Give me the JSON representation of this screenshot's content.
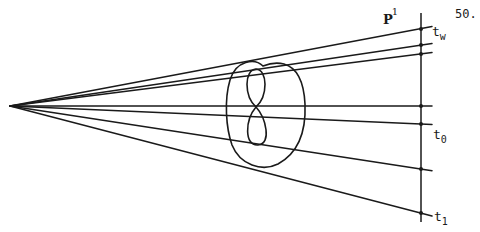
{
  "page_number": "50.",
  "labels": {
    "space": {
      "base": "P",
      "superscript": "1"
    },
    "t_w": {
      "base": "t",
      "subscript": "w"
    },
    "t_0": {
      "base": "t",
      "subscript": "0"
    },
    "t_1": {
      "base": "t",
      "subscript": "1"
    }
  },
  "colors": {
    "ink": "#1a1a1a",
    "background": "#ffffff"
  },
  "geometry": {
    "vertex": [
      10,
      106
    ],
    "axis_line": {
      "x": 421,
      "y_top": 13,
      "y_bottom": 222
    },
    "ray_targets_y": [
      29,
      45,
      54,
      106,
      124,
      169,
      213
    ],
    "ray_end_x": 432,
    "marked_points_y": [
      29,
      45,
      54,
      106,
      124,
      169,
      213
    ]
  }
}
